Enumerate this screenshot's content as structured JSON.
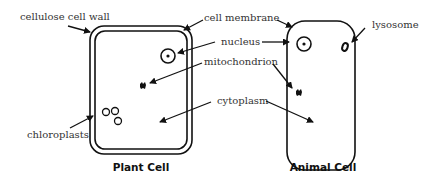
{
  "diagram": {
    "plant_cell": {
      "title": "Plant Cell",
      "labels": {
        "cell_wall": "cellulose cell wall",
        "chloroplasts": "chloroplasts"
      }
    },
    "animal_cell": {
      "title": "Animal Cell",
      "labels": {
        "lysosome": "lysosome"
      }
    },
    "shared_labels": {
      "cell_membrane": "cell membrane",
      "nucleus": "nucleus",
      "mitochondrion": "mitochondrion",
      "cytoplasm": "cytoplasm"
    },
    "colors": {
      "line": "#111111",
      "label_text": "#333333",
      "background": "#ffffff"
    }
  }
}
